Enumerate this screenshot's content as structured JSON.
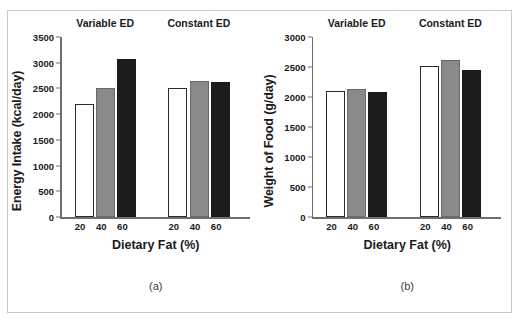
{
  "figure": {
    "panel_a_caption": "(a)",
    "panel_b_caption": "(b)"
  },
  "chart_data": [
    {
      "type": "bar",
      "panel": "(a)",
      "title": "",
      "xlabel": "Dietary Fat (%)",
      "ylabel": "Energy Intake (kcal/day)",
      "ylim": [
        0,
        3500
      ],
      "yticks": [
        0,
        500,
        1000,
        1500,
        2000,
        2500,
        3000,
        3500
      ],
      "ytick_labels": [
        "0",
        "500",
        "1000",
        "1500",
        "2000",
        "2500",
        "3000",
        "3500"
      ],
      "grid": false,
      "legend": "none",
      "groups": [
        {
          "name": "Variable ED",
          "categories": [
            "20",
            "40",
            "60"
          ],
          "values": [
            2200,
            2500,
            3070
          ],
          "colors": [
            "#ffffff",
            "#8a8a8a",
            "#1c1c1c"
          ]
        },
        {
          "name": "Constant ED",
          "categories": [
            "20",
            "40",
            "60"
          ],
          "values": [
            2500,
            2650,
            2630
          ],
          "colors": [
            "#ffffff",
            "#8a8a8a",
            "#1c1c1c"
          ]
        }
      ]
    },
    {
      "type": "bar",
      "panel": "(b)",
      "title": "",
      "xlabel": "Dietary Fat (%)",
      "ylabel": "Weight of Food (g/day)",
      "ylim": [
        0,
        3000
      ],
      "yticks": [
        0,
        500,
        1000,
        1500,
        2000,
        2500,
        3000
      ],
      "ytick_labels": [
        "0",
        "500",
        "1000",
        "1500",
        "2000",
        "2500",
        "3000"
      ],
      "grid": false,
      "legend": "none",
      "groups": [
        {
          "name": "Variable ED",
          "categories": [
            "20",
            "40",
            "60"
          ],
          "values": [
            2100,
            2140,
            2080
          ],
          "colors": [
            "#ffffff",
            "#8a8a8a",
            "#1c1c1c"
          ]
        },
        {
          "name": "Constant ED",
          "categories": [
            "20",
            "40",
            "60"
          ],
          "values": [
            2510,
            2610,
            2450
          ],
          "colors": [
            "#ffffff",
            "#8a8a8a",
            "#1c1c1c"
          ]
        }
      ]
    }
  ]
}
